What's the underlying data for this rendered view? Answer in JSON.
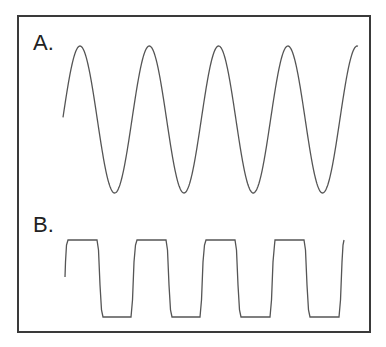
{
  "figure": {
    "panels": [
      {
        "label": "A.",
        "waveform": "sine"
      },
      {
        "label": "B.",
        "waveform": "square"
      }
    ],
    "colors": {
      "line": "#555555",
      "border": "#3a3a3a",
      "background": "#ffffff"
    }
  }
}
